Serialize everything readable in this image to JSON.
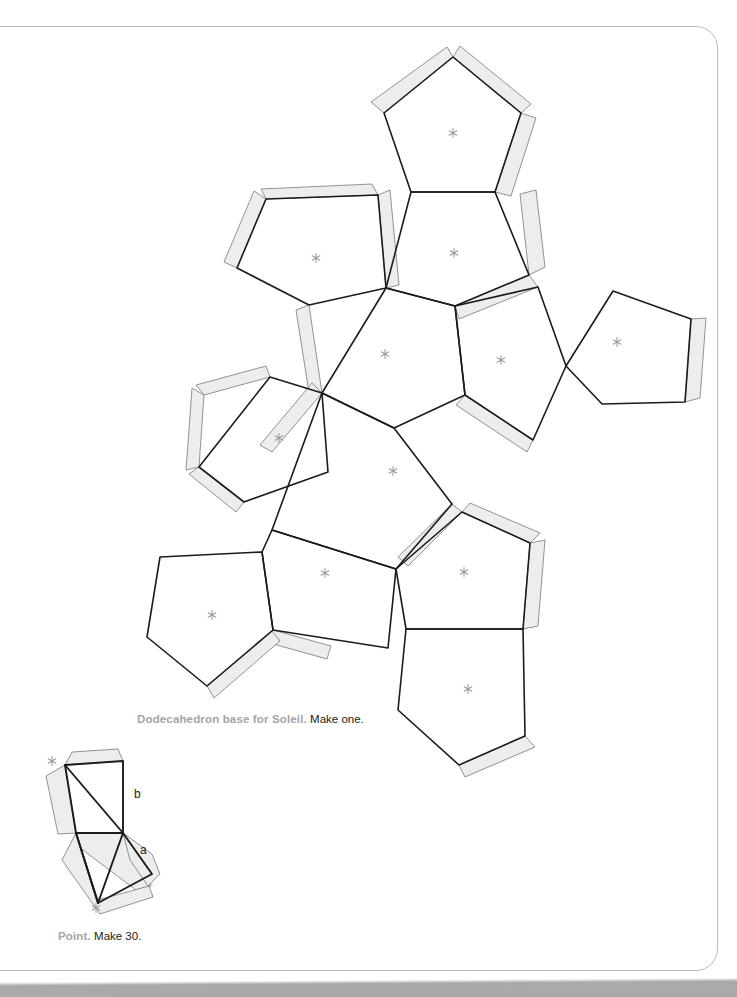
{
  "page": {
    "background_color": "#ffffff",
    "border_color": "#b9bcbe",
    "scan_band_color": "#a8a9ab"
  },
  "style": {
    "fold_line_color": "#1b1b1b",
    "tab_fill_color": "#eceded",
    "tab_outline_color": "#6f7173",
    "asterisk_color": "#9a9c9e"
  },
  "captions": [
    {
      "name": "dodecahedron-caption",
      "lead": "Dodecahedron base for Soleil.",
      "tail": "Make one.",
      "x": 137,
      "y": 712
    },
    {
      "name": "point-caption",
      "lead": "Point.",
      "tail": "Make 30.",
      "x": 58,
      "y": 929
    }
  ],
  "edge_labels": [
    {
      "name": "edge-label-b",
      "text": "b",
      "x": 134,
      "y": 787
    },
    {
      "name": "edge-label-a",
      "text": "a",
      "x": 140,
      "y": 843
    }
  ],
  "net": {
    "name": "dodecahedron-net",
    "shape": "pentagon",
    "face_count": 11,
    "faces": [
      {
        "id": "pentagon-top",
        "cx": 453,
        "cy": 133,
        "r": 77,
        "rot": 0,
        "asterisk": true
      },
      {
        "id": "pentagon-upper-center",
        "cx": 452,
        "cy": 253,
        "r": 77,
        "rot": 180,
        "asterisk": true
      },
      {
        "id": "pentagon-upper-left",
        "cx": 311,
        "cy": 258,
        "r": 77,
        "rot": 144,
        "asterisk": true
      },
      {
        "id": "pentagon-center-left",
        "cx": 382,
        "cy": 353,
        "r": 77,
        "rot": 0,
        "asterisk": true
      },
      {
        "id": "pentagon-center-right",
        "cx": 499,
        "cy": 360,
        "r": 77,
        "rot": 108,
        "asterisk": true
      },
      {
        "id": "pentagon-right",
        "cx": 615,
        "cy": 341,
        "r": 77,
        "rot": 36,
        "asterisk": true
      },
      {
        "id": "pentagon-left",
        "cx": 275,
        "cy": 437,
        "r": 77,
        "rot": 72,
        "asterisk": true
      },
      {
        "id": "pentagon-middle",
        "cx": 392,
        "cy": 470,
        "r": 77,
        "rot": 180,
        "asterisk": true
      },
      {
        "id": "pentagon-lower-left",
        "cx": 212,
        "cy": 617,
        "r": 77,
        "rot": 0,
        "asterisk": true
      },
      {
        "id": "pentagon-lower-center",
        "cx": 324,
        "cy": 573,
        "r": 77,
        "rot": 36,
        "asterisk": true
      },
      {
        "id": "pentagon-lower-right",
        "cx": 462,
        "cy": 572,
        "r": 77,
        "rot": 324,
        "asterisk": true
      },
      {
        "id": "pentagon-bottom",
        "cx": 468,
        "cy": 690,
        "r": 77,
        "rot": 180,
        "asterisk": true
      }
    ]
  },
  "point_piece": {
    "name": "point-piece-net",
    "asterisks": [
      {
        "x": 52,
        "y": 761
      },
      {
        "x": 96,
        "y": 907
      }
    ]
  }
}
